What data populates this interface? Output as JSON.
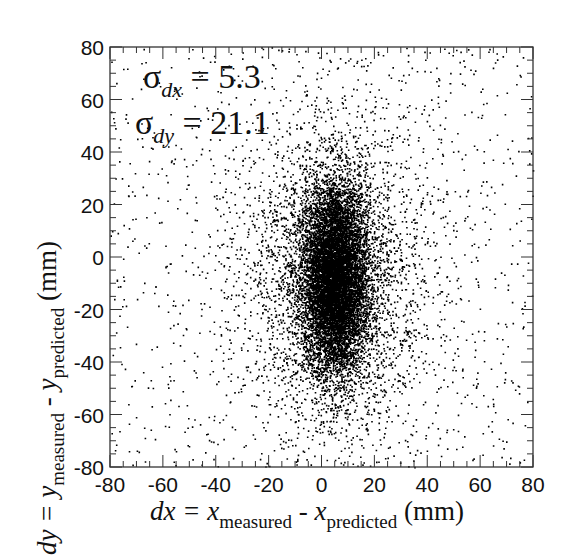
{
  "chart_data": {
    "type": "scatter",
    "title": "",
    "xlabel": {
      "prefix": "dx = x",
      "sub1": "measured",
      "mid": " - x",
      "sub2": "predicted",
      "unit": " (mm)"
    },
    "ylabel": {
      "prefix": "dy = y",
      "sub1": "measured",
      "mid": " - y",
      "sub2": "predicted",
      "unit": " (mm)"
    },
    "xlim": [
      -80,
      80
    ],
    "ylim": [
      -80,
      80
    ],
    "xticks": [
      -80,
      -60,
      -40,
      -20,
      0,
      20,
      40,
      60,
      80
    ],
    "yticks": [
      -80,
      -60,
      -40,
      -20,
      0,
      20,
      40,
      60,
      80
    ],
    "xtick_labels": [
      "-80",
      "-60",
      "-40",
      "-20",
      "0",
      "20",
      "40",
      "60",
      "80"
    ],
    "ytick_labels": [
      "-80",
      "-60",
      "-40",
      "-20",
      "0",
      "20",
      "40",
      "60",
      "80"
    ],
    "grid": false,
    "legend": null,
    "annotations": [
      {
        "symbol": "σ",
        "sub": "dx",
        "text": " = 5.3",
        "x_data": -66,
        "y_data": 62
      },
      {
        "symbol": "σ",
        "sub": "dy",
        "text": " = 21.1",
        "x_data": -69,
        "y_data": 45
      }
    ],
    "distribution": {
      "sigma_dx": 5.3,
      "sigma_dy": 21.1,
      "center": [
        5,
        -8
      ],
      "core_points": 9000,
      "halo_points": 3500,
      "halo_sigma": [
        18,
        30
      ],
      "background_points": 1100,
      "point_color": "#000000"
    }
  }
}
